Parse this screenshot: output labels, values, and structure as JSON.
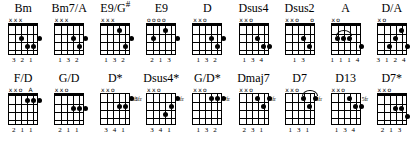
{
  "sheet": {
    "title": "guitar-chord-chart",
    "rows": [
      {
        "chords": [
          {
            "name": "Bm",
            "name_sup": "",
            "topmarks": [
              "x",
              "x",
              "x",
              "",
              "",
              " "
            ],
            "nut": true,
            "frets": 4,
            "dots": [
              {
                "string": 3,
                "fret": 2
              },
              {
                "string": 4,
                "fret": 3
              },
              {
                "string": 5,
                "fret": 3
              },
              {
                "string": 6,
                "fret": 2
              }
            ],
            "barres": [],
            "arc": null,
            "fret_label": "",
            "fret_label_side": "",
            "fingers": "3 2 1"
          },
          {
            "name": "Bm7/A",
            "name_sup": "",
            "topmarks": [
              "x",
              "x",
              "x",
              "",
              "",
              ""
            ],
            "nut": true,
            "frets": 4,
            "dots": [
              {
                "string": 4,
                "fret": 2
              },
              {
                "string": 5,
                "fret": 3
              },
              {
                "string": 6,
                "fret": 2
              }
            ],
            "barres": [],
            "arc": null,
            "fret_label": "",
            "fret_label_side": "",
            "fingers": "1 3 2"
          },
          {
            "name": "E9/G",
            "name_sup": "#",
            "topmarks": [
              "x",
              "x",
              "x",
              "",
              "",
              ""
            ],
            "nut": true,
            "frets": 4,
            "dots": [
              {
                "string": 4,
                "fret": 1
              },
              {
                "string": 5,
                "fret": 3
              },
              {
                "string": 6,
                "fret": 2
              }
            ],
            "barres": [],
            "arc": null,
            "fret_label": "",
            "fret_label_side": "",
            "fingers": "1 3 2"
          },
          {
            "name": "E9",
            "name_sup": "",
            "topmarks": [
              "o",
              "o",
              "o",
              "o",
              "",
              ""
            ],
            "nut": true,
            "frets": 4,
            "dots": [
              {
                "string": 2,
                "fret": 2
              },
              {
                "string": 4,
                "fret": 1
              },
              {
                "string": 6,
                "fret": 2
              }
            ],
            "barres": [],
            "arc": null,
            "fret_label": "",
            "fret_label_side": "",
            "fingers": "2  1  3"
          },
          {
            "name": "D",
            "name_sup": "",
            "topmarks": [
              "x",
              "x",
              "o",
              "",
              "",
              ""
            ],
            "nut": true,
            "frets": 4,
            "dots": [
              {
                "string": 4,
                "fret": 2
              },
              {
                "string": 5,
                "fret": 3
              },
              {
                "string": 6,
                "fret": 2
              }
            ],
            "barres": [],
            "arc": null,
            "fret_label": "",
            "fret_label_side": "",
            "fingers": "1 3 2"
          },
          {
            "name": "Dsus4",
            "name_sup": "",
            "topmarks": [
              "x",
              "x",
              "o",
              "",
              "",
              ""
            ],
            "nut": true,
            "frets": 4,
            "dots": [
              {
                "string": 4,
                "fret": 2
              },
              {
                "string": 5,
                "fret": 3
              },
              {
                "string": 6,
                "fret": 3
              }
            ],
            "barres": [],
            "arc": null,
            "fret_label": "",
            "fret_label_side": "",
            "fingers": "1 3 4"
          },
          {
            "name": "Dsus2",
            "name_sup": "",
            "topmarks": [
              "x",
              "x",
              "o",
              "",
              "",
              "o"
            ],
            "nut": true,
            "frets": 4,
            "dots": [
              {
                "string": 4,
                "fret": 2
              },
              {
                "string": 5,
                "fret": 3
              }
            ],
            "barres": [],
            "arc": null,
            "fret_label": "",
            "fret_label_side": "",
            "fingers": "1 3"
          },
          {
            "name": "A",
            "name_sup": "",
            "topmarks": [
              "x",
              "o",
              "",
              "",
              "",
              ""
            ],
            "nut": true,
            "frets": 4,
            "dots": [
              {
                "string": 2,
                "fret": 2
              },
              {
                "string": 3,
                "fret": 2
              },
              {
                "string": 4,
                "fret": 2
              },
              {
                "string": 6,
                "fret": 3
              }
            ],
            "barres": [],
            "arc": {
              "from": 2,
              "to": 4,
              "fret": 2
            },
            "fret_label": "",
            "fret_label_side": "",
            "fingers": "1 1 1 4"
          },
          {
            "name": "D/A",
            "name_sup": "",
            "topmarks": [
              "x",
              "o",
              "",
              "",
              "",
              ""
            ],
            "nut": true,
            "frets": 4,
            "dots": [
              {
                "string": 3,
                "fret": 3
              },
              {
                "string": 4,
                "fret": 2
              },
              {
                "string": 5,
                "fret": 1
              },
              {
                "string": 6,
                "fret": 3
              }
            ],
            "barres": [],
            "arc": null,
            "fret_label": "",
            "fret_label_side": "",
            "fingers": "3 1 2 4"
          }
        ]
      },
      {
        "chords": [
          {
            "name": "F/D",
            "name_sup": "",
            "topmarks": [
              "x",
              "x",
              "o",
              "",
              "A",
              ""
            ],
            "nut": true,
            "frets": 4,
            "dots": [
              {
                "string": 4,
                "fret": 1
              },
              {
                "string": 5,
                "fret": 1
              },
              {
                "string": 6,
                "fret": 1
              }
            ],
            "barres": [],
            "arc": null,
            "fret_label": "",
            "fret_label_side": "",
            "fingers": "2 1 1"
          },
          {
            "name": "G/D",
            "name_sup": "",
            "topmarks": [
              "x",
              "x",
              "o",
              "",
              "",
              ""
            ],
            "nut": true,
            "frets": 4,
            "dots": [
              {
                "string": 4,
                "fret": 2
              },
              {
                "string": 5,
                "fret": 2
              },
              {
                "string": 6,
                "fret": 2
              }
            ],
            "barres": [],
            "arc": null,
            "fret_label": "",
            "fret_label_side": "",
            "fingers": "2 1 1"
          },
          {
            "name": "D*",
            "name_sup": "",
            "topmarks": [
              "x",
              "x",
              "o",
              "",
              "",
              ""
            ],
            "nut": false,
            "frets": 4,
            "dots": [
              {
                "string": 4,
                "fret": 2
              },
              {
                "string": 5,
                "fret": 2
              },
              {
                "string": 6,
                "fret": 1
              }
            ],
            "barres": [],
            "arc": null,
            "fret_label": "5fr",
            "fret_label_side": "right",
            "fingers": "3 4 1"
          },
          {
            "name": "Dsus4*",
            "name_sup": "",
            "topmarks": [
              "x",
              "x",
              "o",
              "",
              "",
              ""
            ],
            "nut": false,
            "frets": 4,
            "dots": [
              {
                "string": 4,
                "fret": 3
              },
              {
                "string": 5,
                "fret": 2
              },
              {
                "string": 6,
                "fret": 1
              }
            ],
            "barres": [],
            "arc": null,
            "fret_label": "5fr",
            "fret_label_side": "both",
            "fingers": "3 4 1"
          },
          {
            "name": "G/D*",
            "name_sup": "",
            "topmarks": [
              "x",
              "x",
              "o",
              "",
              "",
              ""
            ],
            "nut": false,
            "frets": 4,
            "dots": [
              {
                "string": 4,
                "fret": 1
              },
              {
                "string": 5,
                "fret": 1
              },
              {
                "string": 6,
                "fret": 1
              }
            ],
            "barres": [],
            "arc": null,
            "fret_label": "7fr",
            "fret_label_side": "right",
            "fingers": "1 3 2"
          },
          {
            "name": "Dmaj7",
            "name_sup": "",
            "topmarks": [
              "x",
              "x",
              "o",
              "",
              "",
              ""
            ],
            "nut": false,
            "frets": 4,
            "dots": [
              {
                "string": 4,
                "fret": 1
              },
              {
                "string": 5,
                "fret": 2
              },
              {
                "string": 6,
                "fret": 1
              }
            ],
            "barres": [],
            "arc": null,
            "fret_label": "5fr",
            "fret_label_side": "right",
            "fingers": "2 3 1"
          },
          {
            "name": "D7",
            "name_sup": "",
            "topmarks": [
              "x",
              "x",
              "o",
              "",
              "",
              ""
            ],
            "nut": false,
            "frets": 4,
            "dots": [
              {
                "string": 4,
                "fret": 1
              },
              {
                "string": 5,
                "fret": 2
              },
              {
                "string": 6,
                "fret": 1
              }
            ],
            "barres": [],
            "arc": {
              "from": 4,
              "to": 6,
              "fret": 1
            },
            "fret_label": "5fr",
            "fret_label_side": "right",
            "fingers": "1 3 1"
          },
          {
            "name": "D13",
            "name_sup": "",
            "topmarks": [
              "x",
              "x",
              "o",
              "",
              "",
              ""
            ],
            "nut": false,
            "frets": 4,
            "dots": [
              {
                "string": 4,
                "fret": 1
              },
              {
                "string": 5,
                "fret": 2
              },
              {
                "string": 6,
                "fret": 2
              }
            ],
            "barres": [],
            "arc": null,
            "fret_label": "5fr",
            "fret_label_side": "right",
            "fingers": "1 3 4"
          },
          {
            "name": "D7*",
            "name_sup": "",
            "topmarks": [
              "x",
              "x",
              "o",
              "",
              "",
              ""
            ],
            "nut": true,
            "frets": 4,
            "dots": [
              {
                "string": 4,
                "fret": 2
              },
              {
                "string": 5,
                "fret": 2
              },
              {
                "string": 6,
                "fret": 3
              }
            ],
            "barres": [],
            "arc": null,
            "fret_label": "",
            "fret_label_side": "",
            "fingers": "2 1 3"
          }
        ]
      }
    ]
  }
}
